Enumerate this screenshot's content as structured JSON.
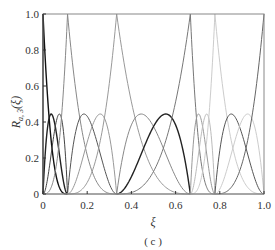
{
  "chart_data": {
    "type": "line",
    "title": "",
    "caption": "( c )",
    "xlabel": "ξ",
    "ylabel": "R_{a,3}(ξ)",
    "ylabel_main": "R",
    "ylabel_sub": "a, 3",
    "ylabel_arg": "(ξ)",
    "xlim": [
      0,
      1
    ],
    "ylim": [
      0,
      1
    ],
    "grid": false,
    "legend": "none",
    "xticks": [
      0,
      0.2,
      0.4,
      0.6,
      0.8,
      1.0
    ],
    "xtick_labels": [
      "0",
      "0.2",
      "0.4",
      "0.6",
      "0.8",
      "1.0"
    ],
    "yticks": [
      0,
      0.2,
      0.4,
      0.6,
      0.8,
      1.0
    ],
    "ytick_labels": [
      "0",
      "0.2",
      "0.4",
      "0.6",
      "0.8",
      "1.0"
    ],
    "knots": [
      0,
      0.1111,
      0.3333,
      0.6667,
      0.7778,
      1.0
    ],
    "spans": [
      {
        "start": 0,
        "end": 0.1111,
        "colors": [
          "#111111",
          "#222222",
          "#444444",
          "#888888"
        ]
      },
      {
        "start": 0.1111,
        "end": 0.3333,
        "colors": [
          "#888888",
          "#555555",
          "#999999",
          "#999999"
        ]
      },
      {
        "start": 0.3333,
        "end": 0.6667,
        "colors": [
          "#999999",
          "#888888",
          "#222222",
          "#777777"
        ]
      },
      {
        "start": 0.6667,
        "end": 0.7778,
        "colors": [
          "#777777",
          "#999999",
          "#bbbbbb",
          "#cccccc"
        ]
      },
      {
        "start": 0.7778,
        "end": 1.0,
        "colors": [
          "#cccccc",
          "#555555",
          "#cccccc",
          "#666666"
        ]
      }
    ],
    "basis": [
      "(1-t)^3",
      "3t(1-t)^2",
      "3t^2(1-t)",
      "t^3"
    ],
    "peak_values": {
      "end_functions": 1.0,
      "interior_functions": 0.444
    }
  },
  "plot_box": {
    "left": 43,
    "right": 264,
    "top": 14,
    "bottom": 194
  },
  "frame_color": "#888888",
  "axis_color": "#333333"
}
